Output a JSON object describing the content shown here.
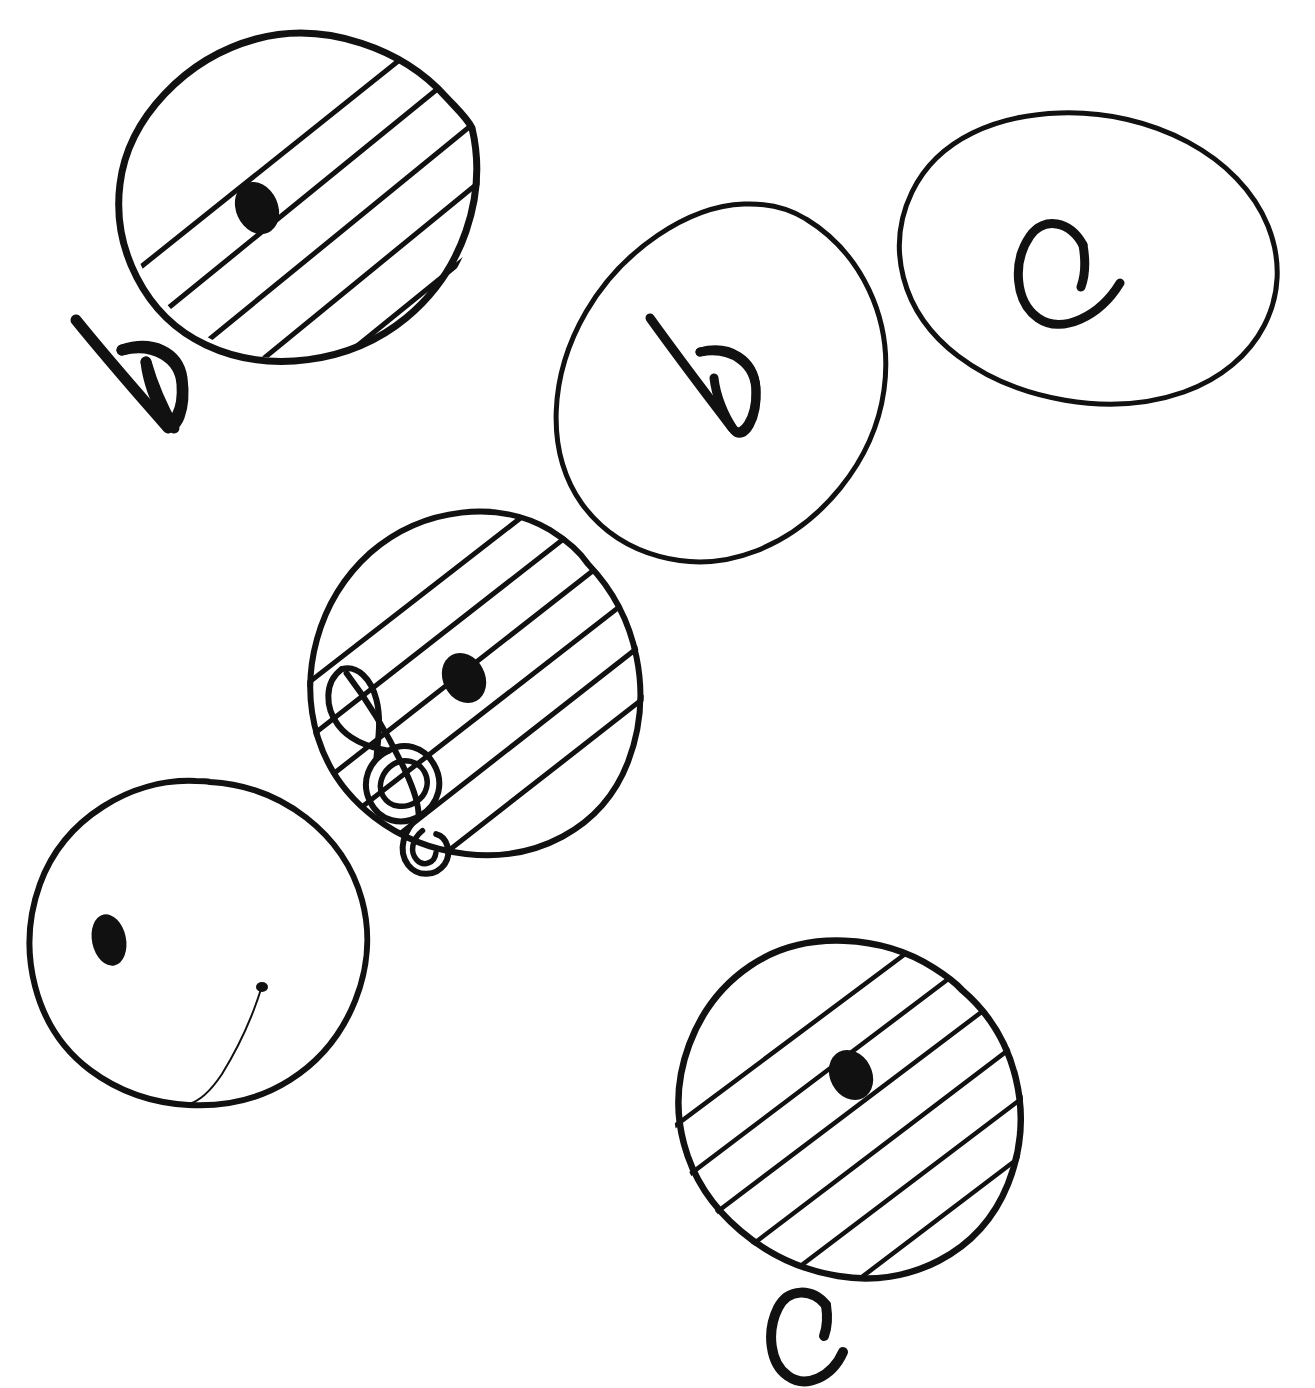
{
  "document": {
    "title": "Hand-drawn musical staff circles",
    "medium": "ink-on-paper-sketch",
    "background_color": "#ffffff",
    "ink_color": "#111111",
    "width": 1315,
    "height": 1388
  },
  "labels": {
    "outside_b": "b",
    "outside_c": "c",
    "inside_b": "b",
    "inside_c": "c"
  },
  "shapes": [
    {
      "id": "circle-top-left-staff",
      "name": "top-left-staff-circle",
      "kind": "ellipse",
      "contents": "staff-lines-with-note-head",
      "staff_line_count": 6,
      "has_note_head": true,
      "has_clef": false,
      "letter": "",
      "cx": 304,
      "cy": 199,
      "rx": 182,
      "ry": 163,
      "rotation": -28
    },
    {
      "id": "circle-top-mid-b",
      "name": "top-middle-b-circle",
      "kind": "ellipse",
      "contents": "letter",
      "staff_line_count": 0,
      "has_note_head": false,
      "has_clef": false,
      "letter": "b",
      "cx": 718,
      "cy": 385,
      "rx": 178,
      "ry": 152,
      "rotation": -32
    },
    {
      "id": "circle-top-right-c",
      "name": "top-right-c-circle",
      "kind": "ellipse",
      "contents": "letter",
      "staff_line_count": 0,
      "has_note_head": false,
      "has_clef": false,
      "letter": "c",
      "cx": 1078,
      "cy": 258,
      "rx": 192,
      "ry": 148,
      "rotation": -8
    },
    {
      "id": "circle-center-clef",
      "name": "center-treble-clef-staff-circle",
      "kind": "ellipse",
      "contents": "staff-lines-with-note-head-and-treble-clef",
      "staff_line_count": 6,
      "has_note_head": true,
      "has_clef": true,
      "clef": "treble-clef",
      "letter": "",
      "cx": 474,
      "cy": 678,
      "rx": 178,
      "ry": 175,
      "rotation": -30
    },
    {
      "id": "circle-left-face",
      "name": "left-smiley-face-circle",
      "kind": "ellipse",
      "contents": "smiley-face",
      "staff_line_count": 0,
      "has_note_head": false,
      "has_clef": false,
      "has_eye_dot": true,
      "has_smile": true,
      "letter": "",
      "cx": 197,
      "cy": 950,
      "rx": 172,
      "ry": 160,
      "rotation": -24
    },
    {
      "id": "circle-bottom-right-staff",
      "name": "bottom-right-staff-circle",
      "kind": "ellipse",
      "contents": "staff-lines-with-note-head",
      "staff_line_count": 6,
      "has_note_head": true,
      "has_clef": false,
      "letter": "",
      "cx": 851,
      "cy": 1107,
      "rx": 182,
      "ry": 162,
      "rotation": -30
    }
  ],
  "annotations": [
    {
      "id": "label-b-outside",
      "name": "handwritten-b-label-top-left",
      "text": "b",
      "x": 128,
      "y": 372,
      "rotation": -35
    },
    {
      "id": "label-c-outside",
      "name": "handwritten-c-label-bottom",
      "text": "c",
      "x": 803,
      "y": 1330,
      "rotation": 0
    }
  ],
  "note_heads": [
    {
      "id": "note-top-left",
      "name": "note-head-top-left",
      "cx": 257,
      "cy": 208
    },
    {
      "id": "note-center",
      "name": "note-head-center",
      "cx": 464,
      "cy": 678
    },
    {
      "id": "note-bottom-right",
      "name": "note-head-bottom-right",
      "cx": 851,
      "cy": 1075
    },
    {
      "id": "eye-left-face",
      "name": "eye-dot-left-face",
      "cx": 109,
      "cy": 940
    }
  ]
}
